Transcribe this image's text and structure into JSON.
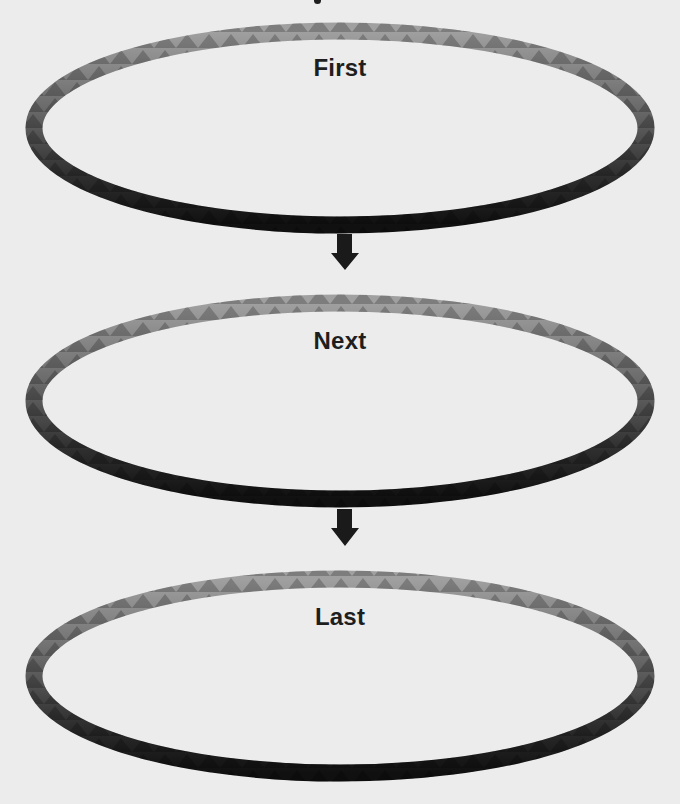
{
  "diagram": {
    "type": "vertical-flow",
    "background_color": "#ececec",
    "ring_colors": {
      "top": "#9a9a9a",
      "mid": "#5a5a5a",
      "bottom": "#141414",
      "tooth_dark": "#3a3a3a"
    },
    "arrow_color": "#1a1a1a",
    "stages": [
      {
        "id": "first",
        "label": "First"
      },
      {
        "id": "next",
        "label": "Next"
      },
      {
        "id": "last",
        "label": "Last"
      }
    ],
    "connectors": [
      {
        "from": "first",
        "to": "next",
        "direction": "down"
      },
      {
        "from": "next",
        "to": "last",
        "direction": "down"
      }
    ]
  }
}
